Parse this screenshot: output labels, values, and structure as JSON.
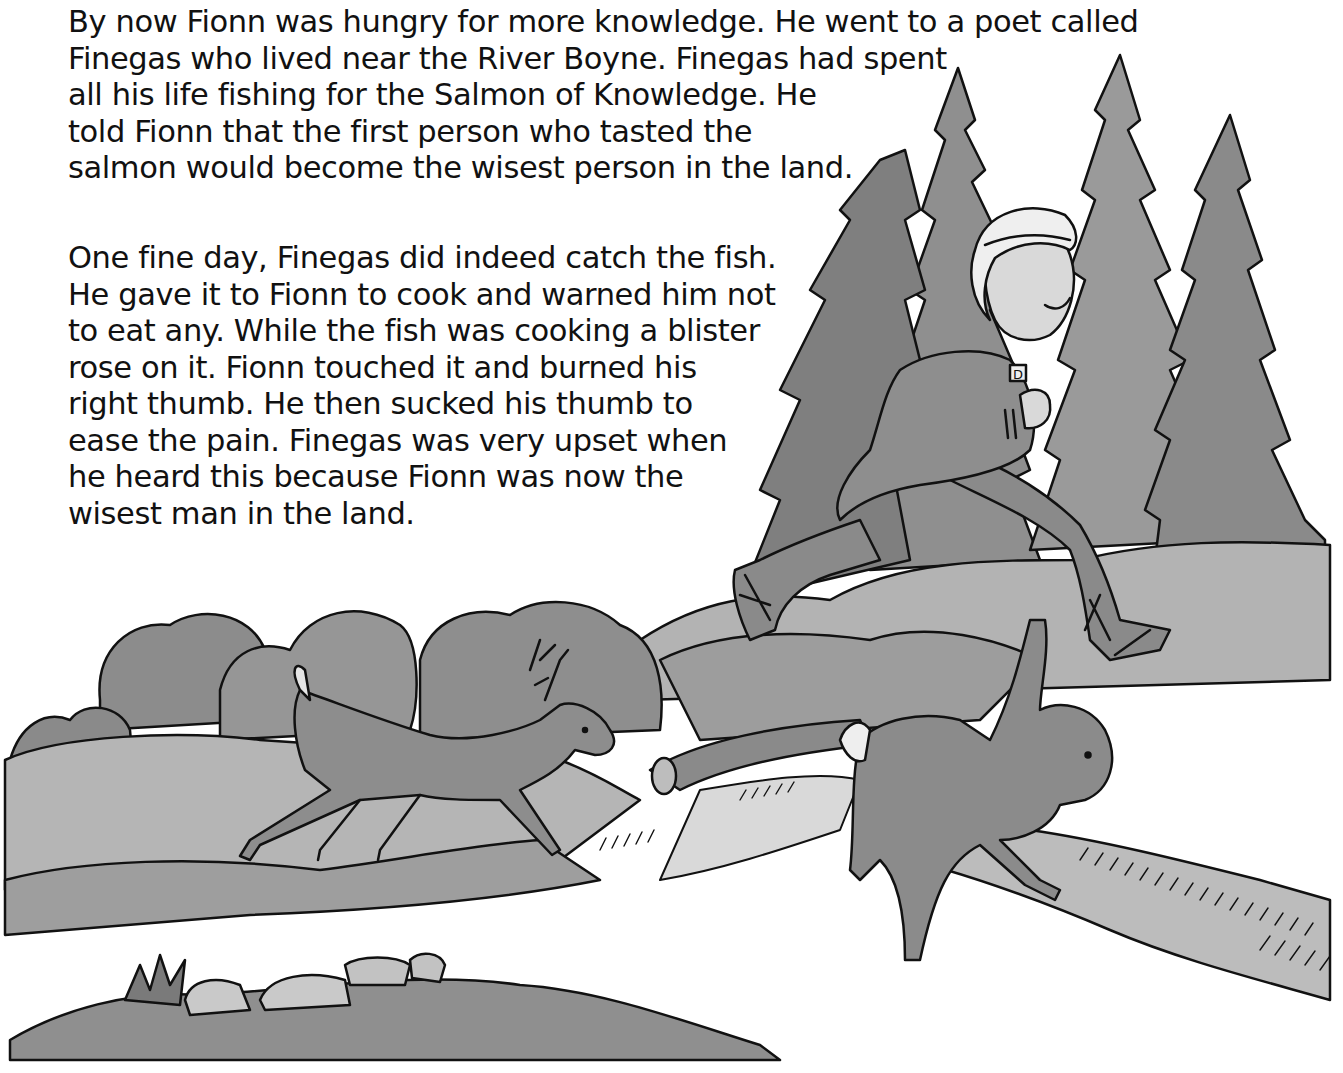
{
  "page": {
    "paragraphs": [
      {
        "lines": [
          "By now Fionn was hungry for more knowledge. He went to a poet called",
          "Finegas who lived near the River Boyne. Finegas had spent",
          "all his life fishing for the Salmon of Knowledge. He",
          "told Fionn that the first person who tasted the",
          "salmon would become the wisest person in the land."
        ]
      },
      {
        "lines": [
          "One fine day, Finegas did indeed catch the fish.",
          "He gave it to Fionn to cook and warned him not",
          "to eat any. While the fish was cooking a blister",
          "rose on it. Fionn touched it and burned his",
          "right thumb. He then sucked his thumb to",
          "ease the pain. Finegas was very upset when",
          "he heard this because Fionn was now the",
          "wisest man in the land."
        ]
      }
    ],
    "illustration": {
      "subjects": [
        "pine-trees",
        "running-boy-fionn",
        "deer",
        "hare",
        "fallen-log",
        "bushes",
        "rocks",
        "hills"
      ],
      "shirt_badge_letter": "D",
      "colors": {
        "ink": "#111111",
        "dark_gray": "#7d7d7d",
        "mid_gray": "#9a9a9a",
        "light_gray": "#c4c4c4",
        "paper": "#ffffff"
      }
    }
  }
}
